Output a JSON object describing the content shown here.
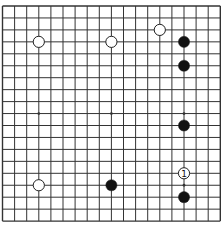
{
  "board": {
    "size": 19,
    "origin_x": 2.5,
    "origin_y": 6,
    "spacing_x": 12.1,
    "spacing_y": 11.95,
    "line_color": "#333333",
    "background": "#ffffff",
    "star_points": [
      [
        3,
        3
      ],
      [
        9,
        3
      ],
      [
        15,
        3
      ],
      [
        3,
        9
      ],
      [
        9,
        9
      ],
      [
        15,
        9
      ],
      [
        3,
        15
      ],
      [
        9,
        15
      ],
      [
        15,
        15
      ]
    ]
  },
  "stones": [
    {
      "color": "white",
      "col": 3,
      "row": 3
    },
    {
      "color": "white",
      "col": 9,
      "row": 3
    },
    {
      "color": "white",
      "col": 13,
      "row": 2
    },
    {
      "color": "black",
      "col": 15,
      "row": 3
    },
    {
      "color": "black",
      "col": 15,
      "row": 5
    },
    {
      "color": "black",
      "col": 15,
      "row": 10
    },
    {
      "color": "white",
      "col": 15,
      "row": 14,
      "label": "1"
    },
    {
      "color": "black",
      "col": 15,
      "row": 16
    },
    {
      "color": "black",
      "col": 9,
      "row": 15
    },
    {
      "color": "white",
      "col": 3,
      "row": 15
    }
  ],
  "colors": {
    "black_stone": "#111111",
    "white_stone": "#ffffff",
    "stone_outline": "#222222"
  }
}
